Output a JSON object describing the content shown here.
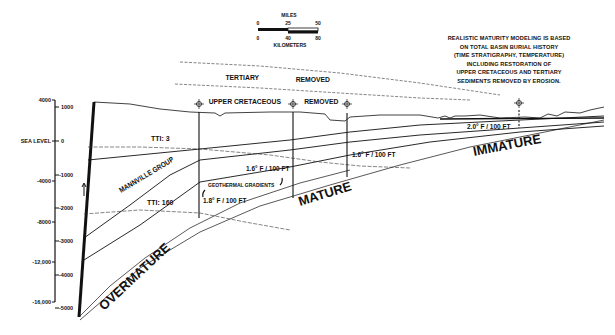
{
  "scale_bar": {
    "miles_label": "MILES",
    "miles_ticks": [
      "0",
      "25",
      "50"
    ],
    "km_ticks": [
      "0",
      "40",
      "80"
    ],
    "km_label": "KILOMETERS"
  },
  "note": {
    "lines": [
      "REALISTIC MATURITY MODELING IS BASED",
      "ON TOTAL BASIN BURIAL HISTORY",
      "(TIME STRATIGRAPHY, TEMPERATURE)",
      "INCLUDING RESTORATION OF",
      "UPPER CRETACEOUS AND TERTIARY",
      "SEDIMENTS REMOVED BY EROSION."
    ]
  },
  "removed_labels": {
    "tertiary": "TERTIARY",
    "tertiary_removed": "REMOVED",
    "upper_cretaceous": "UPPER CRETACEOUS",
    "upper_cretaceous_removed": "REMOVED"
  },
  "axis_feet": {
    "ticks": [
      "4000",
      "SEA LEVEL",
      "-4000",
      "-8000",
      "-12,000",
      "-16,000"
    ]
  },
  "axis_meters": {
    "ticks": [
      "1000",
      "0",
      "-1000",
      "-2000",
      "-3000",
      "-4000",
      "-5000"
    ]
  },
  "maturity_zones": {
    "immature": "IMMATURE",
    "mature": "MATURE",
    "overmature": "OVERMATURE"
  },
  "tti_lines": {
    "tti_3": "TTI: 3",
    "tti_160": "TTI: 160"
  },
  "formation": {
    "mannville": "MANNVILLE GROUP"
  },
  "gradients": {
    "caption": "GEOTHERMAL GRADIENTS",
    "well1": "1.8° F / 100 FT",
    "well2": "1.6° F / 100 FT",
    "well3": "1.6° F / 100 FT",
    "well4": "2.0° F / 100 FT"
  },
  "colors": {
    "ink": "#111111",
    "background": "#ffffff"
  }
}
